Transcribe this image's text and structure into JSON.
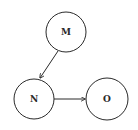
{
  "diagram": {
    "type": "directed-graph",
    "colors": {
      "background": "#ffffff",
      "stroke": "#2a2a2a",
      "text": "#2a2a2a"
    },
    "nodes": [
      {
        "id": "M",
        "label": "M",
        "cx": 66,
        "cy": 32,
        "r": 20
      },
      {
        "id": "N",
        "label": "N",
        "cx": 34,
        "cy": 99,
        "r": 20
      },
      {
        "id": "O",
        "label": "O",
        "cx": 107,
        "cy": 99,
        "r": 21
      }
    ],
    "edges": [
      {
        "from": "M",
        "to": "N",
        "x1": 58,
        "y1": 51,
        "x2": 40,
        "y2": 78
      },
      {
        "from": "N",
        "to": "O",
        "x1": 54,
        "y1": 99,
        "x2": 85,
        "y2": 99
      }
    ]
  }
}
